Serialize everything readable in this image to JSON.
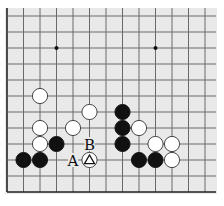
{
  "board": {
    "background": "#e9e9e9",
    "line_color": "#6a6a6a",
    "edge_color": "#222222",
    "origin_x": 7,
    "origin_y": 16,
    "spacing_x": 16.5,
    "spacing_y": 16,
    "cols": 13,
    "rows": 12,
    "visible_edges": [
      "left",
      "bottom"
    ],
    "star_points": [
      [
        3,
        2
      ],
      [
        9,
        2
      ]
    ],
    "stones": [
      {
        "color": "white",
        "col": 2,
        "row": 5
      },
      {
        "color": "white",
        "col": 5,
        "row": 6
      },
      {
        "color": "white",
        "col": 2,
        "row": 7
      },
      {
        "color": "white",
        "col": 4,
        "row": 7
      },
      {
        "color": "white",
        "col": 2,
        "row": 8
      },
      {
        "color": "black",
        "col": 3,
        "row": 8
      },
      {
        "color": "black",
        "col": 1,
        "row": 9
      },
      {
        "color": "black",
        "col": 2,
        "row": 9
      },
      {
        "color": "white",
        "col": 5,
        "row": 9,
        "marker": "triangle"
      },
      {
        "color": "black",
        "col": 7,
        "row": 6
      },
      {
        "color": "black",
        "col": 7,
        "row": 7
      },
      {
        "color": "white",
        "col": 8,
        "row": 7
      },
      {
        "color": "black",
        "col": 7,
        "row": 8
      },
      {
        "color": "white",
        "col": 9,
        "row": 8
      },
      {
        "color": "white",
        "col": 10,
        "row": 8
      },
      {
        "color": "black",
        "col": 8,
        "row": 9
      },
      {
        "color": "black",
        "col": 9,
        "row": 9
      },
      {
        "color": "white",
        "col": 10,
        "row": 9
      }
    ],
    "labels": [
      {
        "text": "B",
        "col": 5,
        "row": 8
      },
      {
        "text": "A",
        "col": 4,
        "row": 9
      }
    ]
  }
}
